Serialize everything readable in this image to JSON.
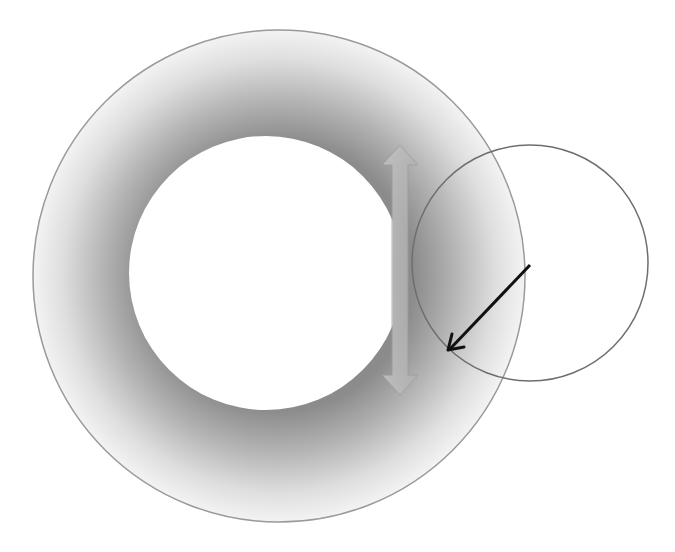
{
  "diagram": {
    "colors": {
      "background": "#ffffff",
      "ring_outer": "#c8c8c8",
      "ring_edge": "#9a9a9a",
      "inner_fill": "#ffffff",
      "double_arrow": "#b4b4b4",
      "small_circle_stroke": "#6e6e6e",
      "pointer_arrow": "#111111"
    },
    "shapes": {
      "outer_circle": {
        "cx": 279,
        "cy": 276,
        "r": 246
      },
      "inner_circle": {
        "cx": 266,
        "cy": 273,
        "r": 137
      },
      "double_arrow": {
        "x": 400,
        "y1": 145,
        "y2": 395
      },
      "small_circle": {
        "cx": 530,
        "cy": 263,
        "r": 118
      },
      "pointer_arrow": {
        "x1": 530,
        "y1": 265,
        "x2": 448,
        "y2": 350
      }
    }
  }
}
